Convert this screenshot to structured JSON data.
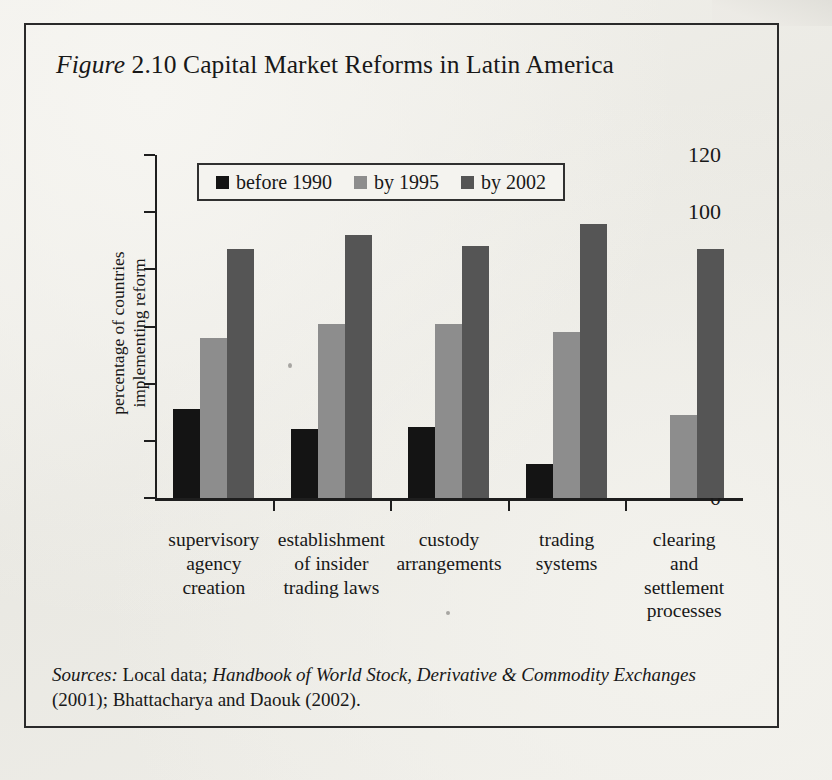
{
  "figure": {
    "label": "Figure",
    "number": "2.10",
    "title": "Capital Market Reforms in Latin America"
  },
  "source_note": {
    "prefix": "Sources:",
    "text_1": " Local data; ",
    "italic_title": "Handbook of World Stock, Derivative & Commodity Exchanges",
    "text_2": " (2001); Bhattacharya and Daouk (2002)."
  },
  "legend": {
    "items": [
      {
        "label": "before 1990",
        "color": "#141414",
        "icon": "legend-square-icon"
      },
      {
        "label": "by 1995",
        "color": "#8d8d8d",
        "icon": "legend-square-icon"
      },
      {
        "label": "by 2002",
        "color": "#555555",
        "icon": "legend-square-icon"
      }
    ]
  },
  "axes": {
    "y_title_line1": "percentage of countries",
    "y_title_line2": "implementing reform",
    "y_ticks": [
      "0",
      "20",
      "40",
      "60",
      "80",
      "100",
      "120"
    ]
  },
  "categories_display": [
    [
      "supervisory",
      "agency",
      "creation"
    ],
    [
      "establishment",
      "of insider",
      "trading laws"
    ],
    [
      "custody",
      "arrangements"
    ],
    [
      "trading",
      "systems"
    ],
    [
      "clearing",
      "and",
      "settlement",
      "processes"
    ]
  ],
  "chart_data": {
    "type": "bar",
    "title": "Figure 2.10 Capital Market Reforms in Latin America",
    "xlabel": "",
    "ylabel": "percentage of countries implementing reform",
    "ylim": [
      0,
      120
    ],
    "yticks": [
      0,
      20,
      40,
      60,
      80,
      100,
      120
    ],
    "grid": false,
    "legend_position": "top-center",
    "categories": [
      "supervisory agency creation",
      "establishment of insider trading laws",
      "custody arrangements",
      "trading systems",
      "clearing and settlement processes"
    ],
    "series": [
      {
        "name": "before 1990",
        "color": "#141414",
        "values": [
          31,
          24,
          25,
          12,
          null
        ]
      },
      {
        "name": "by 1995",
        "color": "#8d8d8d",
        "values": [
          56,
          61,
          61,
          58,
          29
        ]
      },
      {
        "name": "by 2002",
        "color": "#555555",
        "values": [
          87,
          92,
          88,
          96,
          87
        ]
      }
    ]
  }
}
